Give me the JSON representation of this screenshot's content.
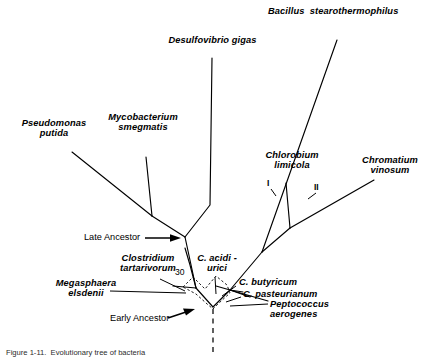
{
  "figure": {
    "type": "phylogenetic-tree",
    "caption": "Figure 1-11.  Evolutionary tree of bacteria"
  },
  "taxa": [
    {
      "id": "pseudomonas-putida",
      "label": "Pseudomonas\nputida"
    },
    {
      "id": "mycobacterium-smegmatis",
      "label": "Mycobacterium\nsmegmatis"
    },
    {
      "id": "desulfovibrio-gigas",
      "label": "Desulfovibrio gigas"
    },
    {
      "id": "bacillus-stearothermophilus",
      "label": "Bacillus  stearothermophilus"
    },
    {
      "id": "chlorobium-limicola",
      "label": "Chlorobium\nlimicola"
    },
    {
      "id": "chromatium-vinosum",
      "label": "Chromatium\nvinosum"
    },
    {
      "id": "clostridium-tartarivorum",
      "label": "Clostridium\ntartarivorum"
    },
    {
      "id": "megasphaera-elsdenii",
      "label": "Megasphaera\nelsdenii"
    },
    {
      "id": "c-acidi-urici",
      "label": "C. acidi -\nurici"
    },
    {
      "id": "c-butyricum",
      "label": "C. butyricum"
    },
    {
      "id": "c-pasteurianum",
      "label": "C. pasteurianum"
    },
    {
      "id": "peptococcus-aerogenes",
      "label": "Peptococcus\naerogenes"
    }
  ],
  "annotations": {
    "late_ancestor": "Late Ancestor",
    "early_ancestor": "Early Ancestor",
    "branch_I": "I",
    "branch_II": "II",
    "distance_30": "30"
  },
  "colors": {
    "line": "#000000",
    "background": "#ffffff",
    "text": "#000000",
    "dotted": "#000000"
  }
}
